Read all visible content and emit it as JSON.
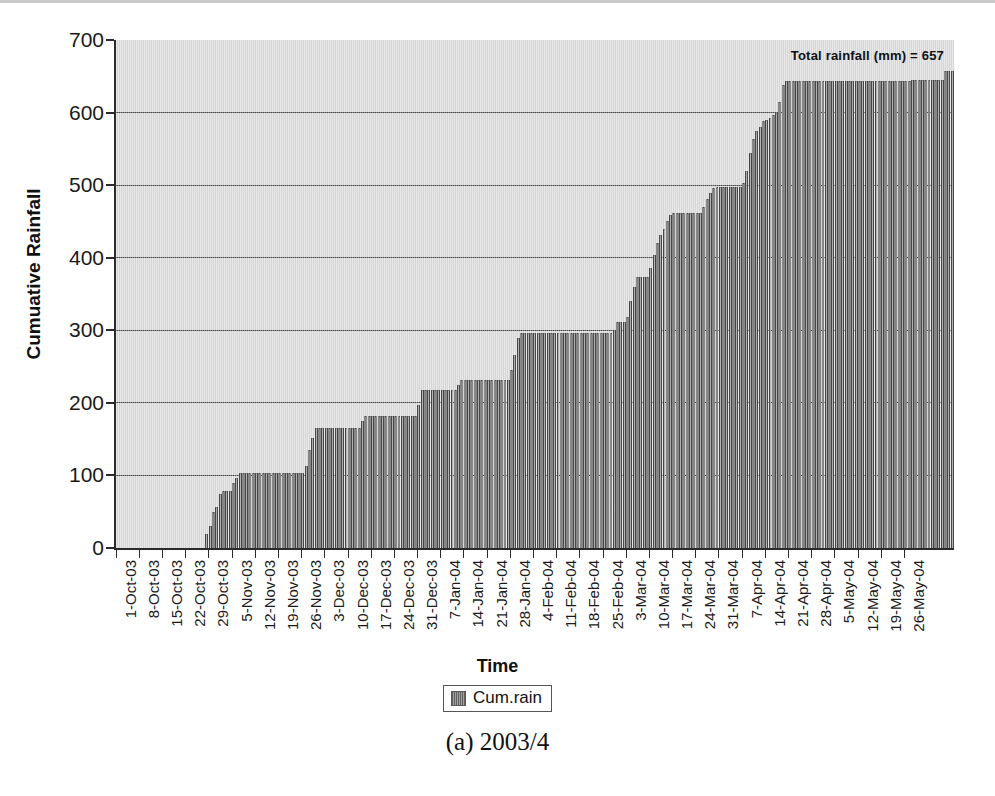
{
  "figure": {
    "caption": "(a) 2003/4",
    "annotation": "Total rainfall (mm) = 657"
  },
  "legend": {
    "swatch_name": "legend-swatch-cum-rain",
    "entries": [
      "Cum.rain"
    ]
  },
  "axes": {
    "xlabel": "Time",
    "ylabel": "Cumuative Rainfall",
    "yticks": [
      "0",
      "100",
      "200",
      "300",
      "400",
      "500",
      "600",
      "700"
    ]
  },
  "colors": {
    "plot_background": "#dcdcdc",
    "bar_fill": "#6e6e6e",
    "axis": "#2b2b2b",
    "gridline": "#4a4a4a",
    "text": "#111111"
  },
  "chart_data": {
    "type": "bar",
    "title": "",
    "subtitle": "",
    "xlabel": "Time",
    "ylabel": "Cumuative Rainfall",
    "ylim": [
      0,
      700
    ],
    "ytick_interval": 100,
    "grid": true,
    "legend_position": "bottom",
    "annotations": [
      "Total rainfall (mm) = 657"
    ],
    "series_name": "Cum.rain",
    "x_start": "1-Oct-03",
    "x_end": "29-May-04",
    "x_interval_days": 1,
    "tick_labels": [
      "1-Oct-03",
      "8-Oct-03",
      "15-Oct-03",
      "22-Oct-03",
      "29-Oct-03",
      "5-Nov-03",
      "12-Nov-03",
      "19-Nov-03",
      "26-Nov-03",
      "3-Dec-03",
      "10-Dec-03",
      "17-Dec-03",
      "24-Dec-03",
      "31-Dec-03",
      "7-Jan-04",
      "14-Jan-04",
      "21-Jan-04",
      "28-Jan-04",
      "4-Feb-04",
      "11-Feb-04",
      "18-Feb-04",
      "25-Feb-04",
      "3-Mar-04",
      "10-Mar-04",
      "17-Mar-04",
      "24-Mar-04",
      "31-Mar-04",
      "7-Apr-04",
      "14-Apr-04",
      "21-Apr-04",
      "28-Apr-04",
      "5-May-04",
      "12-May-04",
      "19-May-04",
      "26-May-04"
    ],
    "tick_interval_days": 7,
    "values": [
      0,
      0,
      0,
      0,
      0,
      0,
      0,
      0,
      0,
      0,
      0,
      0,
      0,
      0,
      0,
      0,
      0,
      0,
      0,
      0,
      0,
      0,
      0,
      0,
      0,
      0,
      0,
      20,
      30,
      50,
      57,
      75,
      78,
      78,
      78,
      90,
      97,
      104,
      104,
      104,
      104,
      104,
      104,
      104,
      104,
      104,
      104,
      104,
      104,
      104,
      104,
      104,
      104,
      104,
      104,
      104,
      104,
      113,
      135,
      152,
      165,
      165,
      165,
      165,
      165,
      165,
      165,
      165,
      165,
      165,
      165,
      165,
      165,
      165,
      175,
      182,
      182,
      182,
      182,
      182,
      182,
      182,
      182,
      182,
      182,
      182,
      182,
      182,
      182,
      182,
      182,
      197,
      218,
      218,
      218,
      218,
      218,
      218,
      218,
      218,
      218,
      218,
      218,
      224,
      232,
      232,
      232,
      232,
      232,
      232,
      232,
      232,
      232,
      232,
      232,
      232,
      232,
      232,
      232,
      245,
      266,
      290,
      296,
      296,
      296,
      296,
      296,
      296,
      296,
      296,
      296,
      296,
      296,
      296,
      296,
      296,
      296,
      296,
      296,
      296,
      296,
      296,
      296,
      296,
      296,
      296,
      296,
      296,
      296,
      296,
      301,
      311,
      311,
      311,
      318,
      340,
      360,
      373,
      374,
      374,
      374,
      386,
      404,
      420,
      431,
      440,
      450,
      459,
      461,
      461,
      461,
      461,
      461,
      461,
      461,
      461,
      461,
      470,
      481,
      489,
      496,
      498,
      498,
      498,
      498,
      498,
      498,
      498,
      498,
      503,
      520,
      545,
      563,
      575,
      580,
      588,
      590,
      592,
      597,
      600,
      615,
      638,
      644,
      644,
      644,
      644,
      644,
      644,
      644,
      644,
      644,
      644,
      644,
      644,
      644,
      644,
      644,
      644,
      644,
      644,
      644,
      644,
      644,
      644,
      644,
      644,
      644,
      644,
      644,
      644,
      644,
      644,
      644,
      644,
      644,
      644,
      644,
      644,
      644,
      644,
      645,
      645,
      645,
      645,
      645,
      645,
      645,
      645,
      645,
      645,
      657,
      657,
      657
    ]
  }
}
